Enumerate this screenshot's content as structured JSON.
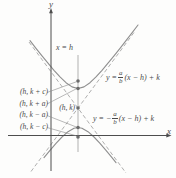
{
  "figure": {
    "axis": {
      "x_label": "x",
      "y_label": "y"
    },
    "vertical_line_label": "x = h",
    "center_label": "(h, k)",
    "point_labels": [
      "(h, k + c)",
      "(h, k + a)",
      "(h, k − a)",
      "(h, k − c)"
    ],
    "equations": {
      "positive": {
        "prefix": "y = ",
        "num": "a",
        "den": "b",
        "suffix": "(x − h) + k"
      },
      "negative": {
        "prefix": "y = −",
        "num": "a",
        "den": "b",
        "suffix": "(x − h) + k"
      }
    },
    "colors": {
      "axis": "#4d4d4d",
      "curve": "#8f8f8f",
      "asymptote": "#9a9a9a",
      "guide_line": "#c6c6c6",
      "leader_line": "#8a8a8a",
      "dot": "#6b6b6b",
      "text": "#4a4a4a",
      "background": "#fdfdfc"
    }
  }
}
